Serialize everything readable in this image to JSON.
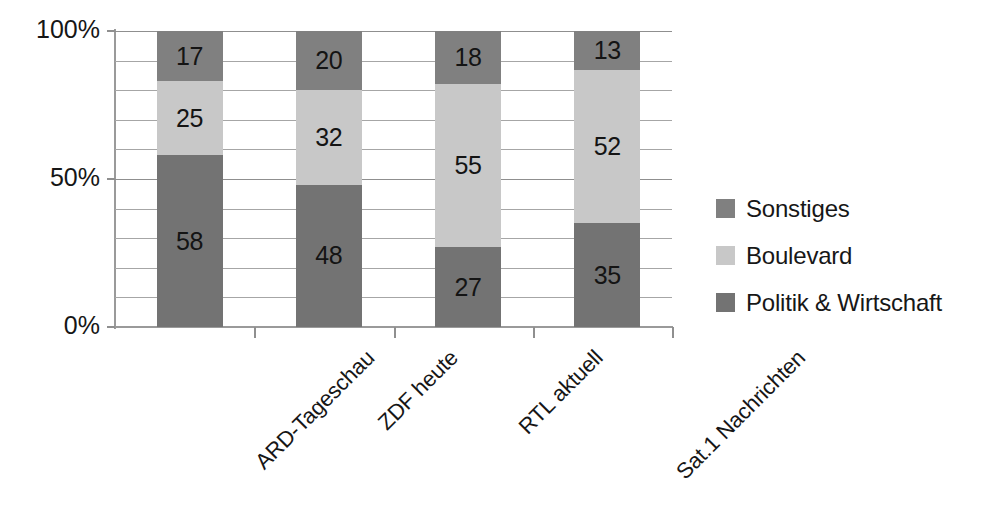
{
  "chart_data": {
    "type": "bar",
    "subtype": "stacked-100-percent",
    "title": "",
    "subtitle": "",
    "xlabel": "",
    "ylabel": "",
    "categories": [
      "ARD-Tageschau",
      "ZDF heute",
      "RTL aktuell",
      "Sat.1 Nachrichten"
    ],
    "series": [
      {
        "name": "Politik & Wirtschaft",
        "color": "#737373",
        "values": [
          58,
          48,
          27,
          35
        ]
      },
      {
        "name": "Boulevard",
        "color": "#c8c8c8",
        "values": [
          25,
          32,
          55,
          52
        ]
      },
      {
        "name": "Sonstiges",
        "color": "#808080",
        "values": [
          17,
          20,
          18,
          13
        ]
      }
    ],
    "stack_order_bottom_to_top": [
      "Politik & Wirtschaft",
      "Boulevard",
      "Sonstiges"
    ],
    "ylim": [
      0,
      100
    ],
    "y_major_ticks": [
      "0%",
      "50%",
      "100%"
    ],
    "y_major_values": [
      0,
      50,
      100
    ],
    "y_minor_values": [
      10,
      20,
      30,
      40,
      60,
      70,
      80,
      90
    ],
    "grid": true,
    "grid_axis": "y",
    "legend_position": "right",
    "legend_order": [
      "Sonstiges",
      "Boulevard",
      "Politik & Wirtschaft"
    ],
    "data_labels": true,
    "x_tick_label_rotation": -45
  },
  "axis": {
    "y_labels": [
      {
        "text": "100%",
        "value": 100
      },
      {
        "text": "50%",
        "value": 50
      },
      {
        "text": "0%",
        "value": 0
      }
    ]
  },
  "legend": {
    "entries": [
      {
        "label": "Sonstiges",
        "color": "#808080"
      },
      {
        "label": "Boulevard",
        "color": "#c8c8c8"
      },
      {
        "label": "Politik & Wirtschaft",
        "color": "#737373"
      }
    ]
  },
  "colors": {
    "sonstiges": "#808080",
    "boulevard": "#c8c8c8",
    "politik_wirtschaft": "#737373",
    "axis": "#9a9a9a",
    "grid": "#a6a6a6",
    "text": "#161616",
    "background": "#ffffff"
  }
}
